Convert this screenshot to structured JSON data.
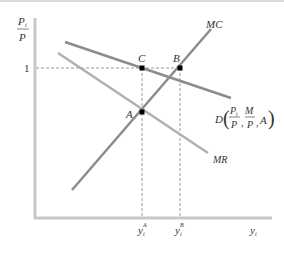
{
  "diagram": {
    "y_axis_label": {
      "numerator": "P",
      "numerator_sub": "i",
      "denominator": "P"
    },
    "x_axis_label": {
      "main": "y",
      "sub": "i"
    },
    "y_tick": "1",
    "x_ticks": [
      {
        "main": "y",
        "sub": "i",
        "sup": "A"
      },
      {
        "main": "y",
        "sub": "i",
        "sup": "B"
      }
    ],
    "curves": {
      "mc": "MC",
      "mr": "MR",
      "demand": {
        "prefix": "D",
        "frac1_num": "P",
        "frac1_num_sub": "i",
        "frac1_den": "P",
        "frac2_num": "M",
        "frac2_den": "P",
        "last": "A"
      }
    },
    "points": {
      "a": "A",
      "b": "B",
      "c": "C"
    },
    "colors": {
      "axis": "#c8c8c8",
      "curve": "#8c8c8c",
      "dashed": "#9a9a9a",
      "point": "#000000",
      "text": "#333333"
    }
  }
}
